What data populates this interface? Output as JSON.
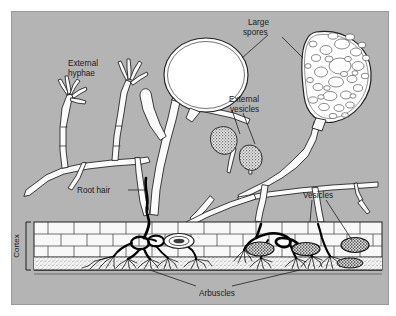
{
  "figure": {
    "name": "vesicular-arbuscular-mycorrhiza-diagram",
    "background_color": "#b3b3b3",
    "panel_color": "#b5b5b5",
    "outer_color": "#ffffff",
    "line_color": "#1a1a1a",
    "hypha_fill": "#fbfbfb",
    "cortex_fill": "#f7f7f7"
  },
  "labels": {
    "external_hyphae": "External\nhyphae",
    "external_hyphae_line1": "External",
    "external_hyphae_line2": "hyphae",
    "large_spores_line1": "Large",
    "large_spores_line2": "spores",
    "external_vesicles_line1": "External",
    "external_vesicles_line2": "vesicles",
    "root_hair": "Root hair",
    "vesicles": "Vesicles",
    "arbuscles": "Arbuscles",
    "cortex": "Cortex"
  },
  "structures": {
    "large_spore_left": "large-spore-empty",
    "large_spore_right": "large-spore-with-oil-globules",
    "external_vesicle_upper": "stippled-vesicle",
    "external_vesicle_lower": "stippled-vesicle",
    "cortex_cells": "brick-pattern-root-cortex",
    "arbuscule_count": 5,
    "internal_vesicle_count": 5
  }
}
